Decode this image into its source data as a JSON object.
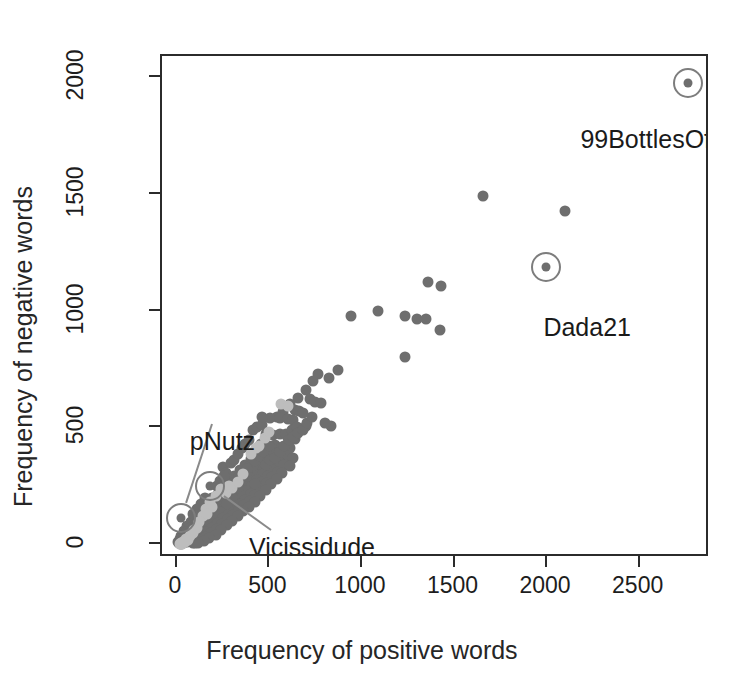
{
  "chart_data": {
    "type": "scatter",
    "title": "",
    "xlabel": "Frequency of positive words",
    "ylabel": "Frequency of negative words",
    "xlim": [
      -80,
      2880
    ],
    "ylim": [
      -60,
      2090
    ],
    "xticks": [
      0,
      500,
      1000,
      1500,
      2000,
      2500
    ],
    "yticks": [
      0,
      500,
      1000,
      1500,
      2000
    ],
    "xtick_labels": [
      "0",
      "500",
      "1000",
      "1500",
      "2000",
      "2500"
    ],
    "ytick_labels": [
      "0",
      "500",
      "1000",
      "1500",
      "2000"
    ],
    "grid": false,
    "legend": null,
    "marker_colors": {
      "primary": "#6e6e6e",
      "light": "#bdbdbd",
      "ring": "#7d7d7d"
    },
    "annotations": [
      {
        "label": "99BottlesOfBeerInMyF",
        "point": [
          2760,
          1975
        ],
        "label_x": 2180,
        "label_y": 1795,
        "ring": true,
        "leader": false
      },
      {
        "label": "Dada21",
        "point": [
          1995,
          1185
        ],
        "label_x": 1980,
        "label_y": 990,
        "ring": true,
        "leader": false
      },
      {
        "label": "pNutz",
        "point": [
          20,
          110
        ],
        "label_x": 70,
        "label_y": 500,
        "ring": true,
        "leader": true
      },
      {
        "label": "Vicissidude",
        "point": [
          180,
          250
        ],
        "label_x": 390,
        "label_y": 45,
        "ring": true,
        "leader": true
      }
    ],
    "series": [
      {
        "name": "blogs",
        "color": "#6e6e6e",
        "points": [
          [
            1655,
            1490
          ],
          [
            2095,
            1425
          ],
          [
            1355,
            1120
          ],
          [
            1425,
            1105
          ],
          [
            940,
            975
          ],
          [
            1085,
            1000
          ],
          [
            1235,
            975
          ],
          [
            1295,
            965
          ],
          [
            1345,
            965
          ],
          [
            1420,
            915
          ],
          [
            1230,
            800
          ],
          [
            760,
            730
          ],
          [
            735,
            700
          ],
          [
            820,
            710
          ],
          [
            870,
            745
          ],
          [
            700,
            660
          ],
          [
            655,
            625
          ],
          [
            720,
            620
          ],
          [
            745,
            610
          ],
          [
            780,
            605
          ],
          [
            610,
            600
          ],
          [
            640,
            575
          ],
          [
            660,
            570
          ],
          [
            575,
            565
          ],
          [
            540,
            545
          ],
          [
            505,
            540
          ],
          [
            555,
            540
          ],
          [
            600,
            535
          ],
          [
            630,
            530
          ],
          [
            835,
            505
          ],
          [
            800,
            520
          ],
          [
            700,
            505
          ],
          [
            480,
            470
          ],
          [
            520,
            465
          ],
          [
            560,
            470
          ],
          [
            600,
            455
          ],
          [
            640,
            450
          ],
          [
            455,
            430
          ],
          [
            490,
            420
          ],
          [
            530,
            425
          ],
          [
            570,
            415
          ],
          [
            610,
            410
          ],
          [
            420,
            400
          ],
          [
            450,
            395
          ],
          [
            480,
            390
          ],
          [
            510,
            385
          ],
          [
            540,
            390
          ],
          [
            575,
            380
          ],
          [
            600,
            375
          ],
          [
            630,
            370
          ],
          [
            400,
            365
          ],
          [
            430,
            360
          ],
          [
            460,
            355
          ],
          [
            490,
            350
          ],
          [
            520,
            345
          ],
          [
            550,
            350
          ],
          [
            580,
            340
          ],
          [
            610,
            335
          ],
          [
            370,
            340
          ],
          [
            395,
            335
          ],
          [
            420,
            330
          ],
          [
            445,
            325
          ],
          [
            470,
            320
          ],
          [
            495,
            325
          ],
          [
            520,
            315
          ],
          [
            545,
            310
          ],
          [
            570,
            305
          ],
          [
            340,
            315
          ],
          [
            365,
            310
          ],
          [
            390,
            305
          ],
          [
            415,
            300
          ],
          [
            440,
            295
          ],
          [
            465,
            300
          ],
          [
            490,
            290
          ],
          [
            515,
            285
          ],
          [
            540,
            280
          ],
          [
            310,
            290
          ],
          [
            335,
            285
          ],
          [
            360,
            280
          ],
          [
            385,
            275
          ],
          [
            410,
            270
          ],
          [
            435,
            275
          ],
          [
            460,
            265
          ],
          [
            485,
            260
          ],
          [
            510,
            255
          ],
          [
            280,
            265
          ],
          [
            305,
            260
          ],
          [
            330,
            255
          ],
          [
            355,
            250
          ],
          [
            380,
            245
          ],
          [
            405,
            250
          ],
          [
            430,
            240
          ],
          [
            455,
            235
          ],
          [
            480,
            230
          ],
          [
            250,
            240
          ],
          [
            275,
            235
          ],
          [
            300,
            230
          ],
          [
            325,
            225
          ],
          [
            350,
            220
          ],
          [
            375,
            225
          ],
          [
            400,
            215
          ],
          [
            425,
            210
          ],
          [
            450,
            205
          ],
          [
            220,
            215
          ],
          [
            245,
            210
          ],
          [
            270,
            205
          ],
          [
            295,
            200
          ],
          [
            320,
            195
          ],
          [
            345,
            200
          ],
          [
            370,
            190
          ],
          [
            395,
            185
          ],
          [
            420,
            180
          ],
          [
            190,
            195
          ],
          [
            215,
            190
          ],
          [
            240,
            185
          ],
          [
            265,
            180
          ],
          [
            290,
            175
          ],
          [
            315,
            180
          ],
          [
            340,
            170
          ],
          [
            365,
            165
          ],
          [
            390,
            160
          ],
          [
            165,
            175
          ],
          [
            185,
            170
          ],
          [
            210,
            165
          ],
          [
            235,
            160
          ],
          [
            260,
            155
          ],
          [
            285,
            160
          ],
          [
            310,
            150
          ],
          [
            335,
            145
          ],
          [
            360,
            140
          ],
          [
            140,
            155
          ],
          [
            160,
            150
          ],
          [
            180,
            145
          ],
          [
            205,
            140
          ],
          [
            230,
            135
          ],
          [
            255,
            140
          ],
          [
            280,
            130
          ],
          [
            305,
            125
          ],
          [
            330,
            120
          ],
          [
            115,
            135
          ],
          [
            135,
            130
          ],
          [
            155,
            125
          ],
          [
            175,
            120
          ],
          [
            200,
            115
          ],
          [
            225,
            120
          ],
          [
            250,
            110
          ],
          [
            275,
            105
          ],
          [
            300,
            100
          ],
          [
            95,
            115
          ],
          [
            110,
            110
          ],
          [
            130,
            105
          ],
          [
            150,
            100
          ],
          [
            170,
            95
          ],
          [
            195,
            100
          ],
          [
            220,
            90
          ],
          [
            245,
            85
          ],
          [
            270,
            80
          ],
          [
            75,
            95
          ],
          [
            90,
            90
          ],
          [
            105,
            85
          ],
          [
            125,
            80
          ],
          [
            145,
            75
          ],
          [
            165,
            80
          ],
          [
            190,
            70
          ],
          [
            215,
            65
          ],
          [
            240,
            60
          ],
          [
            55,
            75
          ],
          [
            70,
            70
          ],
          [
            85,
            65
          ],
          [
            100,
            60
          ],
          [
            120,
            55
          ],
          [
            140,
            60
          ],
          [
            160,
            50
          ],
          [
            185,
            45
          ],
          [
            210,
            40
          ],
          [
            40,
            55
          ],
          [
            50,
            50
          ],
          [
            65,
            45
          ],
          [
            80,
            40
          ],
          [
            95,
            35
          ],
          [
            115,
            40
          ],
          [
            135,
            30
          ],
          [
            155,
            28
          ],
          [
            175,
            25
          ],
          [
            25,
            35
          ],
          [
            35,
            30
          ],
          [
            45,
            25
          ],
          [
            60,
            22
          ],
          [
            75,
            20
          ],
          [
            90,
            25
          ],
          [
            105,
            18
          ],
          [
            125,
            15
          ],
          [
            145,
            12
          ],
          [
            15,
            20
          ],
          [
            22,
            15
          ],
          [
            30,
            12
          ],
          [
            40,
            10
          ],
          [
            55,
            8
          ],
          [
            70,
            12
          ],
          [
            85,
            6
          ],
          [
            100,
            5
          ],
          [
            115,
            4
          ],
          [
            8,
            8
          ],
          [
            12,
            5
          ],
          [
            18,
            3
          ],
          [
            25,
            2
          ],
          [
            35,
            4
          ],
          [
            250,
            330
          ],
          [
            265,
            305
          ],
          [
            295,
            345
          ],
          [
            310,
            360
          ],
          [
            330,
            385
          ],
          [
            350,
            410
          ],
          [
            370,
            430
          ],
          [
            390,
            445
          ],
          [
            405,
            330
          ],
          [
            425,
            355
          ],
          [
            445,
            375
          ],
          [
            465,
            395
          ],
          [
            215,
            250
          ],
          [
            235,
            270
          ],
          [
            255,
            290
          ],
          [
            410,
            490
          ],
          [
            435,
            500
          ],
          [
            460,
            510
          ],
          [
            590,
            470
          ],
          [
            620,
            490
          ],
          [
            650,
            500
          ],
          [
            460,
            545
          ],
          [
            500,
            420
          ],
          [
            420,
            255
          ],
          [
            330,
            240
          ],
          [
            300,
            200
          ],
          [
            270,
            170
          ],
          [
            350,
            290
          ],
          [
            380,
            320
          ],
          [
            150,
            195
          ],
          [
            130,
            170
          ],
          [
            110,
            150
          ],
          [
            90,
            130
          ],
          [
            480,
            340
          ],
          [
            505,
            360
          ],
          [
            530,
            370
          ],
          [
            555,
            395
          ],
          [
            580,
            420
          ],
          [
            605,
            445
          ],
          [
            630,
            460
          ],
          [
            655,
            475
          ],
          [
            680,
            490
          ],
          [
            705,
            520
          ],
          [
            730,
            545
          ],
          [
            680,
            560
          ]
        ]
      },
      {
        "name": "blogs-light",
        "color": "#bdbdbd",
        "points": [
          [
            565,
            600
          ],
          [
            600,
            590
          ],
          [
            430,
            410
          ],
          [
            445,
            420
          ],
          [
            400,
            385
          ],
          [
            240,
            235
          ],
          [
            265,
            220
          ],
          [
            300,
            240
          ],
          [
            180,
            180
          ],
          [
            155,
            150
          ],
          [
            140,
            120
          ],
          [
            120,
            95
          ],
          [
            95,
            60
          ],
          [
            70,
            35
          ],
          [
            50,
            20
          ],
          [
            35,
            10
          ],
          [
            25,
            5
          ],
          [
            210,
            205
          ],
          [
            330,
            265
          ],
          [
            355,
            300
          ],
          [
            280,
            250
          ],
          [
            190,
            160
          ],
          [
            165,
            130
          ],
          [
            110,
            70
          ],
          [
            85,
            45
          ],
          [
            60,
            18
          ],
          [
            45,
            8
          ],
          [
            30,
            2
          ],
          [
            20,
            0
          ],
          [
            15,
            2
          ],
          [
            475,
            455
          ],
          [
            500,
            480
          ]
        ]
      }
    ]
  }
}
